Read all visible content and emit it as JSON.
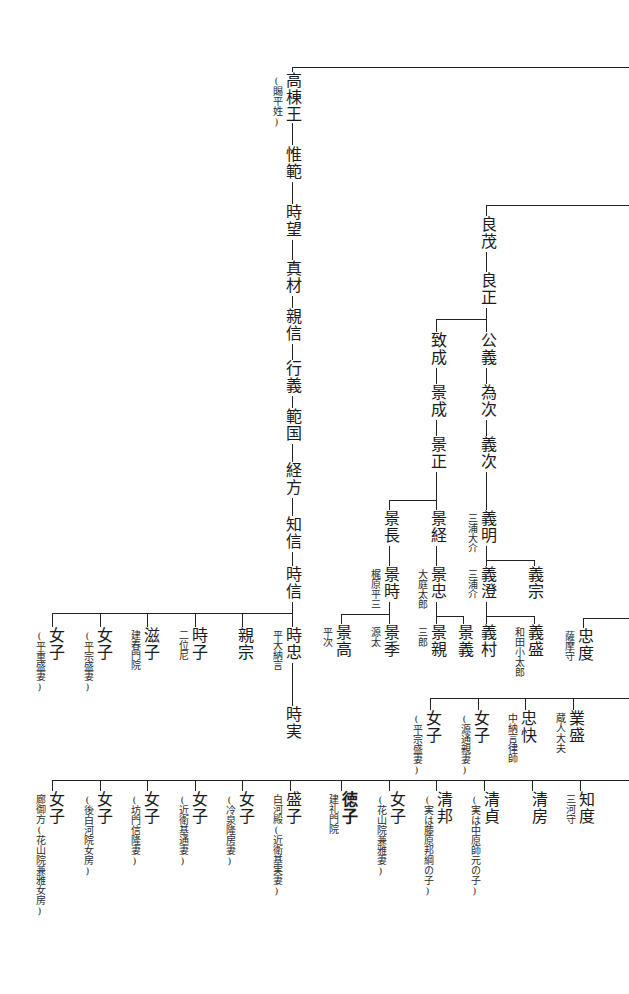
{
  "nodes": [
    {
      "id": "takamune",
      "label": "高棟王",
      "x": 284,
      "y": 72,
      "note": "(賜平姓)",
      "note_side": "left"
    },
    {
      "id": "korenori",
      "label": "惟範",
      "x": 284,
      "y": 146
    },
    {
      "id": "tokimochi",
      "label": "時望",
      "x": 284,
      "y": 204
    },
    {
      "id": "sanezane",
      "label": "真材",
      "x": 284,
      "y": 260
    },
    {
      "id": "chikanobu",
      "label": "親信",
      "x": 284,
      "y": 308
    },
    {
      "id": "yukiyoshi",
      "label": "行義",
      "x": 284,
      "y": 360
    },
    {
      "id": "norikuni",
      "label": "範国",
      "x": 284,
      "y": 408
    },
    {
      "id": "tsunekata",
      "label": "経方",
      "x": 284,
      "y": 462
    },
    {
      "id": "tomonobu",
      "label": "知信",
      "x": 284,
      "y": 516
    },
    {
      "id": "tokinobu",
      "label": "時信",
      "x": 284,
      "y": 566
    },
    {
      "id": "yoshimochi",
      "label": "良茂",
      "x": 479,
      "y": 216
    },
    {
      "id": "yoshimasa",
      "label": "良正",
      "x": 479,
      "y": 272
    },
    {
      "id": "kimiyoshi",
      "label": "公義",
      "x": 479,
      "y": 332
    },
    {
      "id": "tametsugu",
      "label": "為次",
      "x": 479,
      "y": 384
    },
    {
      "id": "yoshitsugu",
      "label": "義次",
      "x": 479,
      "y": 436
    },
    {
      "id": "yoshiaki",
      "label": "義明",
      "x": 479,
      "y": 510,
      "note": "三浦大介",
      "note_side": "left"
    },
    {
      "id": "yoshizumi",
      "label": "義澄",
      "x": 479,
      "y": 566,
      "note": "三浦介",
      "note_side": "left"
    },
    {
      "id": "yoshimune",
      "label": "義宗",
      "x": 526,
      "y": 566
    },
    {
      "id": "yoshimura",
      "label": "義村",
      "x": 479,
      "y": 624
    },
    {
      "id": "yoshimori",
      "label": "義盛",
      "x": 526,
      "y": 624,
      "note": "和田小太郎",
      "note_side": "left"
    },
    {
      "id": "munenari",
      "label": "致成",
      "x": 429,
      "y": 332
    },
    {
      "id": "kagenari",
      "label": "景成",
      "x": 429,
      "y": 384
    },
    {
      "id": "kagemasa",
      "label": "景正",
      "x": 429,
      "y": 436
    },
    {
      "id": "kagenaga",
      "label": "景長",
      "x": 382,
      "y": 510
    },
    {
      "id": "kagetsune",
      "label": "景経",
      "x": 429,
      "y": 510
    },
    {
      "id": "kagetoki",
      "label": "景時",
      "x": 382,
      "y": 566,
      "note": "梶原平三",
      "note_side": "left"
    },
    {
      "id": "kagetada",
      "label": "景忠",
      "x": 429,
      "y": 566,
      "note": "大庭太郎",
      "note_side": "left"
    },
    {
      "id": "kagetaka",
      "label": "景高",
      "x": 334,
      "y": 624,
      "note": "平次",
      "note_side": "left"
    },
    {
      "id": "kagesue",
      "label": "景季",
      "x": 382,
      "y": 624,
      "note": "源太",
      "note_side": "left"
    },
    {
      "id": "kagechika",
      "label": "景親",
      "x": 429,
      "y": 624,
      "note": "三郎",
      "note_side": "left"
    },
    {
      "id": "kageyoshi",
      "label": "景義",
      "x": 456,
      "y": 624
    },
    {
      "id": "tadanori",
      "label": "忠度",
      "x": 576,
      "y": 628,
      "note": "薩摩守",
      "note_side": "left"
    },
    {
      "id": "woman_a",
      "label": "女子",
      "x": 424,
      "y": 710,
      "note": "(平宗盛妻)",
      "note_side": "left"
    },
    {
      "id": "woman_b",
      "label": "女子",
      "x": 472,
      "y": 710,
      "note": "(源通親妻)",
      "note_side": "left"
    },
    {
      "id": "tadakai",
      "label": "忠快",
      "x": 519,
      "y": 710,
      "note": "中納言律師",
      "note_side": "left"
    },
    {
      "id": "narimori",
      "label": "業盛",
      "x": 567,
      "y": 710,
      "note": "蔵人大夫",
      "note_side": "left"
    },
    {
      "id": "tokitada",
      "label": "時忠",
      "x": 284,
      "y": 627,
      "note": "平大納言",
      "note_side": "left"
    },
    {
      "id": "tokizane",
      "label": "時実",
      "x": 284,
      "y": 706
    },
    {
      "id": "chikamune",
      "label": "親宗",
      "x": 236,
      "y": 627
    },
    {
      "id": "tokiko",
      "label": "時子",
      "x": 190,
      "y": 627,
      "note": "二位尼",
      "note_side": "left"
    },
    {
      "id": "shigeko",
      "label": "滋子",
      "x": 142,
      "y": 627,
      "note": "建春門院",
      "note_side": "left"
    },
    {
      "id": "woman_c",
      "label": "女子",
      "x": 95,
      "y": 627,
      "note": "(平宗盛妻)",
      "note_side": "left"
    },
    {
      "id": "woman_d",
      "label": "女子",
      "x": 47,
      "y": 627,
      "note": "(平重盛妻)",
      "note_side": "left"
    },
    {
      "id": "woman_e",
      "label": "女子",
      "x": 47,
      "y": 791,
      "note": "廊御方(花山院兼雅女房)",
      "note_side": "left"
    },
    {
      "id": "woman_f",
      "label": "女子",
      "x": 95,
      "y": 791,
      "note": "(後白河院女房)",
      "note_side": "left"
    },
    {
      "id": "woman_g",
      "label": "女子",
      "x": 142,
      "y": 791,
      "note": "(坊門信隆妻)",
      "note_side": "left"
    },
    {
      "id": "woman_h",
      "label": "女子",
      "x": 190,
      "y": 791,
      "note": "(近衛基通妻)",
      "note_side": "left"
    },
    {
      "id": "woman_i",
      "label": "女子",
      "x": 237,
      "y": 791,
      "note": "(冷泉隆房妻)",
      "note_side": "left"
    },
    {
      "id": "moriko",
      "label": "盛子",
      "x": 284,
      "y": 791,
      "note": "白河殿(近衛基実妻)",
      "note_side": "left"
    },
    {
      "id": "tokuko",
      "label": "徳子",
      "x": 340,
      "y": 791,
      "note": "建礼門院",
      "note_side": "left",
      "bold": true
    },
    {
      "id": "woman_j",
      "label": "女子",
      "x": 388,
      "y": 791,
      "note": "(花山院兼雅妻)",
      "note_side": "left"
    },
    {
      "id": "kiyokuni",
      "label": "清邦",
      "x": 435,
      "y": 791,
      "note": "(実は藤原邦綱の子)",
      "note_side": "left"
    },
    {
      "id": "kiyosada",
      "label": "清貞",
      "x": 482,
      "y": 791,
      "note": "(実は中原師元の子)",
      "note_side": "left"
    },
    {
      "id": "kiyofusa",
      "label": "清房",
      "x": 530,
      "y": 791
    },
    {
      "id": "tomonori",
      "label": "知度",
      "x": 577,
      "y": 791,
      "note": "三河守",
      "note_side": "left"
    }
  ],
  "lines": [
    {
      "t": "h",
      "x": 292,
      "y": 67,
      "len": 337
    },
    {
      "t": "v",
      "x": 292,
      "y": 67,
      "len": 8
    },
    {
      "t": "v",
      "x": 292,
      "y": 123,
      "len": 22
    },
    {
      "t": "v",
      "x": 292,
      "y": 182,
      "len": 22
    },
    {
      "t": "v",
      "x": 292,
      "y": 240,
      "len": 20
    },
    {
      "t": "v",
      "x": 292,
      "y": 296,
      "len": 12
    },
    {
      "t": "v",
      "x": 292,
      "y": 344,
      "len": 16
    },
    {
      "t": "v",
      "x": 292,
      "y": 396,
      "len": 12
    },
    {
      "t": "v",
      "x": 292,
      "y": 444,
      "len": 18
    },
    {
      "t": "v",
      "x": 292,
      "y": 498,
      "len": 18
    },
    {
      "t": "v",
      "x": 292,
      "y": 552,
      "len": 14
    },
    {
      "t": "v",
      "x": 292,
      "y": 602,
      "len": 25
    },
    {
      "t": "v",
      "x": 292,
      "y": 663,
      "len": 43
    },
    {
      "t": "h",
      "x": 52,
      "y": 613,
      "len": 240
    },
    {
      "t": "v",
      "x": 52,
      "y": 613,
      "len": 14
    },
    {
      "t": "v",
      "x": 100,
      "y": 613,
      "len": 14
    },
    {
      "t": "v",
      "x": 147,
      "y": 613,
      "len": 14
    },
    {
      "t": "v",
      "x": 195,
      "y": 613,
      "len": 14
    },
    {
      "t": "v",
      "x": 242,
      "y": 613,
      "len": 14
    },
    {
      "t": "h",
      "x": 486,
      "y": 205,
      "len": 143
    },
    {
      "t": "v",
      "x": 486,
      "y": 205,
      "len": 11
    },
    {
      "t": "v",
      "x": 486,
      "y": 252,
      "len": 20
    },
    {
      "t": "v",
      "x": 486,
      "y": 308,
      "len": 24
    },
    {
      "t": "h",
      "x": 436,
      "y": 319,
      "len": 50
    },
    {
      "t": "v",
      "x": 436,
      "y": 319,
      "len": 13
    },
    {
      "t": "v",
      "x": 486,
      "y": 368,
      "len": 16
    },
    {
      "t": "v",
      "x": 436,
      "y": 368,
      "len": 16
    },
    {
      "t": "v",
      "x": 486,
      "y": 420,
      "len": 16
    },
    {
      "t": "v",
      "x": 436,
      "y": 420,
      "len": 16
    },
    {
      "t": "v",
      "x": 486,
      "y": 472,
      "len": 38
    },
    {
      "t": "v",
      "x": 436,
      "y": 472,
      "len": 38
    },
    {
      "t": "h",
      "x": 389,
      "y": 500,
      "len": 47
    },
    {
      "t": "v",
      "x": 389,
      "y": 500,
      "len": 10
    },
    {
      "t": "v",
      "x": 389,
      "y": 546,
      "len": 20
    },
    {
      "t": "v",
      "x": 436,
      "y": 546,
      "len": 20
    },
    {
      "t": "v",
      "x": 486,
      "y": 546,
      "len": 20
    },
    {
      "t": "h",
      "x": 486,
      "y": 560,
      "len": 48
    },
    {
      "t": "v",
      "x": 534,
      "y": 560,
      "len": 6
    },
    {
      "t": "v",
      "x": 389,
      "y": 602,
      "len": 22
    },
    {
      "t": "h",
      "x": 341,
      "y": 614,
      "len": 48
    },
    {
      "t": "v",
      "x": 341,
      "y": 614,
      "len": 10
    },
    {
      "t": "v",
      "x": 436,
      "y": 602,
      "len": 22
    },
    {
      "t": "h",
      "x": 436,
      "y": 616,
      "len": 27
    },
    {
      "t": "v",
      "x": 463,
      "y": 616,
      "len": 8
    },
    {
      "t": "v",
      "x": 486,
      "y": 602,
      "len": 22
    },
    {
      "t": "h",
      "x": 486,
      "y": 616,
      "len": 48
    },
    {
      "t": "v",
      "x": 534,
      "y": 616,
      "len": 8
    },
    {
      "t": "h",
      "x": 583,
      "y": 618,
      "len": 46
    },
    {
      "t": "v",
      "x": 583,
      "y": 618,
      "len": 10
    },
    {
      "t": "h",
      "x": 430,
      "y": 698,
      "len": 199
    },
    {
      "t": "v",
      "x": 430,
      "y": 698,
      "len": 12
    },
    {
      "t": "v",
      "x": 478,
      "y": 698,
      "len": 12
    },
    {
      "t": "v",
      "x": 525,
      "y": 698,
      "len": 12
    },
    {
      "t": "v",
      "x": 573,
      "y": 698,
      "len": 12
    },
    {
      "t": "h",
      "x": 52,
      "y": 780,
      "len": 577
    },
    {
      "t": "v",
      "x": 52,
      "y": 780,
      "len": 11
    },
    {
      "t": "v",
      "x": 100,
      "y": 780,
      "len": 11
    },
    {
      "t": "v",
      "x": 147,
      "y": 780,
      "len": 11
    },
    {
      "t": "v",
      "x": 195,
      "y": 780,
      "len": 11
    },
    {
      "t": "v",
      "x": 242,
      "y": 780,
      "len": 11
    },
    {
      "t": "v",
      "x": 290,
      "y": 780,
      "len": 11
    },
    {
      "t": "v",
      "x": 341,
      "y": 780,
      "len": 11
    },
    {
      "t": "v",
      "x": 389,
      "y": 780,
      "len": 11
    },
    {
      "t": "v",
      "x": 436,
      "y": 780,
      "len": 11
    },
    {
      "t": "v",
      "x": 484,
      "y": 780,
      "len": 11
    },
    {
      "t": "v",
      "x": 532,
      "y": 780,
      "len": 11
    },
    {
      "t": "v",
      "x": 580,
      "y": 780,
      "len": 11
    }
  ]
}
